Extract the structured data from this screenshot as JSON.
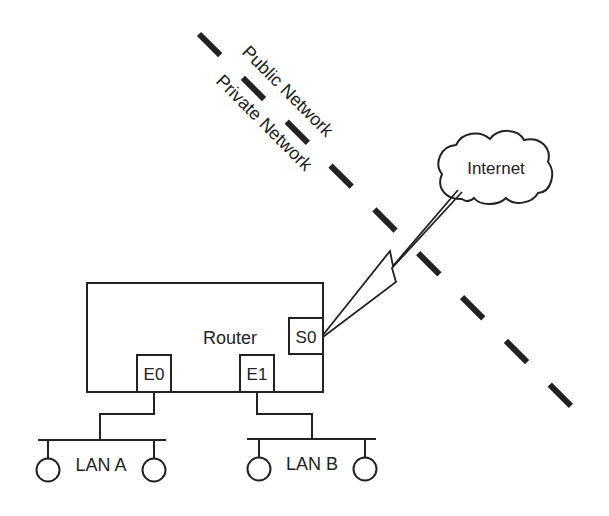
{
  "diagram": {
    "type": "network-topology",
    "colors": {
      "line": "#222222",
      "background": "#ffffff"
    },
    "boundary": {
      "label_public": "Public Network",
      "label_private": "Private Network",
      "style": "dashed"
    },
    "cloud": {
      "label": "Internet"
    },
    "router": {
      "label": "Router",
      "interfaces": [
        {
          "id": "S0",
          "label": "S0"
        },
        {
          "id": "E0",
          "label": "E0"
        },
        {
          "id": "E1",
          "label": "E1"
        }
      ]
    },
    "lans": [
      {
        "id": "A",
        "label": "LAN A",
        "interface": "E0",
        "hosts": 2
      },
      {
        "id": "B",
        "label": "LAN B",
        "interface": "E1",
        "hosts": 2
      }
    ],
    "links": [
      {
        "from": "S0",
        "to": "Internet",
        "type": "serial-wan"
      },
      {
        "from": "E0",
        "to": "LAN A",
        "type": "ethernet"
      },
      {
        "from": "E1",
        "to": "LAN B",
        "type": "ethernet"
      }
    ]
  }
}
